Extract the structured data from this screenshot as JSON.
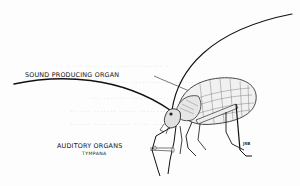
{
  "figure": {
    "labels": {
      "sound_organ": "SOUND PRODUCING ORGAN",
      "auditory": "AUDITORY ORGANS",
      "auditory_sub": "TYMPANA"
    },
    "signature": "JSB"
  },
  "colors": {
    "ink": "#111111",
    "paper": "#fdfdfd",
    "bleed_through": "#cfcfcf"
  }
}
